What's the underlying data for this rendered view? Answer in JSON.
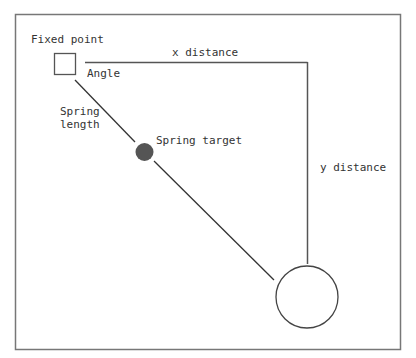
{
  "diagram": {
    "type": "spring-physics-diagram",
    "labels": {
      "fixed_point": "Fixed point",
      "x_distance": "x distance",
      "angle": "Angle",
      "spring_length_line1": "Spring",
      "spring_length_line2": "length",
      "spring_target": "Spring target",
      "y_distance": "y distance"
    },
    "colors": {
      "stroke": "#444444",
      "frame": "#777777",
      "target_fill": "#555555",
      "background": "#ffffff"
    }
  }
}
